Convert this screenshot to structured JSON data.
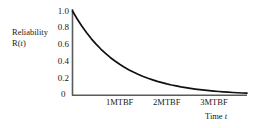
{
  "chart_data": {
    "type": "line",
    "title": "",
    "subtitle": "",
    "ylabel_line1": "Reliability",
    "ylabel_line2_prefix": "R",
    "ylabel_line2_paren_open": "(",
    "ylabel_line2_var": "t",
    "ylabel_line2_paren_close": ")",
    "ylabel_full": "Reliability R(t)",
    "xlabel_prefix": "Time ",
    "xlabel_var": "t",
    "xlabel_full": "Time t",
    "x_tick_labels": [
      "1MTBF",
      "2MTBF",
      "3MTBF"
    ],
    "x_tick_values": [
      1,
      2,
      3
    ],
    "y_tick_labels": [
      "1.0",
      "0.8",
      "0.6",
      "0.4",
      "0.2",
      "0"
    ],
    "y_tick_values": [
      1.0,
      0.8,
      0.6,
      0.4,
      0.2,
      0
    ],
    "origin_label": "0",
    "xlim": [
      0,
      3.7
    ],
    "ylim": [
      0,
      1.06
    ],
    "grid": false,
    "legend": false,
    "legend_position": "none",
    "series": [
      {
        "name": "R(t) = e^(-t/MTBF)",
        "x": [
          0.0,
          0.1,
          0.2,
          0.3,
          0.4,
          0.5,
          0.6,
          0.7,
          0.8,
          0.9,
          1.0,
          1.1,
          1.2,
          1.3,
          1.4,
          1.5,
          1.6,
          1.7,
          1.8,
          1.9,
          2.0,
          2.1,
          2.2,
          2.3,
          2.4,
          2.5,
          2.6,
          2.7,
          2.8,
          2.9,
          3.0,
          3.1,
          3.2,
          3.3,
          3.4,
          3.5,
          3.6,
          3.7
        ],
        "y": [
          1.0,
          0.905,
          0.819,
          0.741,
          0.67,
          0.607,
          0.549,
          0.497,
          0.449,
          0.407,
          0.368,
          0.333,
          0.301,
          0.273,
          0.247,
          0.223,
          0.202,
          0.183,
          0.165,
          0.15,
          0.135,
          0.122,
          0.111,
          0.1,
          0.091,
          0.082,
          0.074,
          0.067,
          0.061,
          0.055,
          0.05,
          0.045,
          0.041,
          0.037,
          0.033,
          0.03,
          0.027,
          0.025
        ]
      }
    ],
    "curve_color": "#111111",
    "axis_color": "#555555",
    "background_color": "#ffffff"
  }
}
